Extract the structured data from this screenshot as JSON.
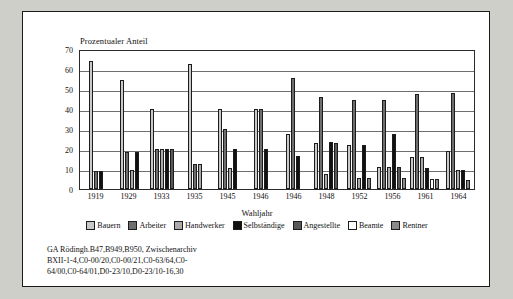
{
  "chart_data": {
    "type": "bar",
    "title": "Prozentualer Anteil",
    "ylabel": "Prozentualer Anteil",
    "xlabel": "Wahljahr",
    "ylim": [
      0,
      70
    ],
    "yticks": [
      0,
      10,
      20,
      30,
      40,
      50,
      60,
      70
    ],
    "grid": true,
    "legend_position": "bottom",
    "categories": [
      "1919",
      "1929",
      "1933",
      "1935",
      "1945",
      "1946",
      "1946",
      "1948",
      "1952",
      "1956",
      "1961",
      "1964"
    ],
    "series": [
      {
        "name": "Bauern",
        "color": "#c9c9c9",
        "values": [
          64.0,
          54.5,
          40.0,
          62.5,
          40.0,
          40.0,
          27.5,
          23.0,
          22.0,
          11.0,
          16.0,
          19.0
        ]
      },
      {
        "name": "Arbeiter",
        "color": "#6e6e6e",
        "values": [
          9.0,
          18.5,
          20.0,
          12.5,
          30.0,
          40.0,
          55.5,
          46.0,
          44.5,
          44.5,
          47.5,
          48.0
        ]
      },
      {
        "name": "Handwerker",
        "color": "#aaaaaa",
        "values": [
          0,
          9.5,
          20.0,
          12.5,
          10.5,
          0,
          0,
          7.5,
          5.5,
          11.0,
          16.0,
          9.5
        ]
      },
      {
        "name": "Selbständige",
        "color": "#111111",
        "values": [
          9.0,
          18.5,
          20.0,
          0,
          20.0,
          20.0,
          16.5,
          23.5,
          22.0,
          27.5,
          10.5,
          9.5
        ]
      },
      {
        "name": "Angestellte",
        "color": "#595959",
        "values": [
          0,
          0,
          20.0,
          0,
          0,
          0,
          0,
          23.0,
          0,
          11.0,
          0,
          0
        ]
      },
      {
        "name": "Beamte",
        "color": "#ffffff",
        "values": [
          0,
          0,
          0,
          0,
          0,
          0,
          0,
          0,
          0,
          0,
          5.0,
          0
        ]
      },
      {
        "name": "Rentner",
        "color": "#8a8a8a",
        "values": [
          0,
          0,
          0,
          0,
          0,
          0,
          0,
          0,
          5.5,
          5.5,
          5.0,
          4.5
        ]
      }
    ]
  },
  "note": {
    "line1": "GA Rödingh.B47,B949,B950, Zwischenarchiv",
    "line2": "BXII-1-4,C0-00/20,C0-00/21,C0-63/64,C0-",
    "line3": "64/00,C0-64/01,D0-23/10,D0-23/10-16,30"
  }
}
